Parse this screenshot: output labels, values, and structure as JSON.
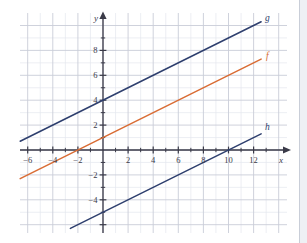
{
  "chart_data": {
    "type": "line",
    "title": "",
    "xlabel": "x",
    "ylabel": "y",
    "xlim": [
      -6.6,
      13.6
    ],
    "ylim": [
      -6.6,
      9.9
    ],
    "grid": true,
    "grid_step": 1,
    "major_step": 2,
    "legend": "inline-end-labels",
    "x_ticks": [
      -6,
      -4,
      -2,
      2,
      4,
      6,
      8,
      10,
      12
    ],
    "x_tick_labels": [
      "−6",
      "−4",
      "−2",
      "2",
      "4",
      "6",
      "8",
      "10",
      "12"
    ],
    "y_ticks": [
      8,
      6,
      4,
      2,
      -2,
      -4
    ],
    "y_tick_labels": [
      "8",
      "6",
      "4",
      "2",
      "−2",
      "−4"
    ],
    "series": [
      {
        "name": "g",
        "label": "g",
        "color": "#2e3f6e",
        "slope": 0.5,
        "intercept": 4,
        "x_start": -6.6,
        "x_end": 12.6,
        "y_start": 0.7,
        "y_end": 10.3,
        "label_x": 13.1,
        "label_y": 10.5
      },
      {
        "name": "f",
        "label": "f",
        "color": "#d96c34",
        "slope": 0.5,
        "intercept": 1,
        "x_start": -6.6,
        "x_end": 12.6,
        "y_start": -2.3,
        "y_end": 7.3,
        "label_x": 13.1,
        "label_y": 7.5
      },
      {
        "name": "h",
        "label": "h",
        "color": "#2e3f6e",
        "slope": 0.5,
        "intercept": -5,
        "x_start": -2.6,
        "x_end": 12.6,
        "y_start": -6.3,
        "y_end": 1.3,
        "label_x": 13.1,
        "label_y": 1.8
      }
    ],
    "colors": {
      "navy": "#2e3f6e",
      "orange": "#d96c34",
      "axis": "#3a3a48",
      "grid_minor": "#e4e7ee",
      "grid_major": "#c9cdd8",
      "background": "#ffffff"
    }
  }
}
